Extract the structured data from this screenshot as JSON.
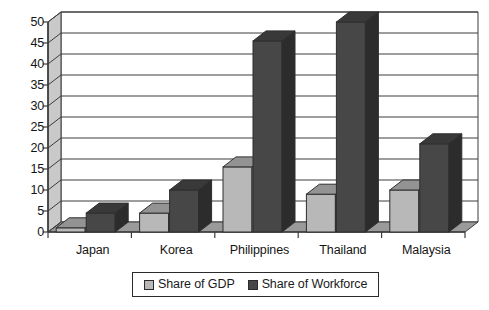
{
  "chart_data": {
    "type": "bar",
    "title": "",
    "subtitle": "",
    "xlabel": "",
    "ylabel": "",
    "categories": [
      "Japan",
      "Korea",
      "Philippines",
      "Thailand",
      "Malaysia"
    ],
    "series": [
      {
        "name": "Share of GDP",
        "values": [
          1,
          4.5,
          15.5,
          9,
          10
        ],
        "color": "#b8b8b8"
      },
      {
        "name": "Share of Workforce",
        "values": [
          4.5,
          10,
          45.5,
          50,
          21
        ],
        "color": "#474747"
      }
    ],
    "ylim": [
      0,
      50
    ],
    "yticks": [
      0,
      5,
      10,
      15,
      20,
      25,
      30,
      35,
      40,
      45,
      50
    ],
    "ytick_labels": [
      "0",
      "5",
      "10",
      "15",
      "20",
      "25",
      "30",
      "35",
      "40",
      "45",
      "50"
    ],
    "grid": true,
    "grid_axis": "y",
    "legend_position": "bottom",
    "style": "3d-column",
    "background": "#ffffff",
    "frame_color": "#3c3c3c"
  },
  "legend": {
    "entries": [
      {
        "label": "Share of GDP",
        "swatch": "light-gray"
      },
      {
        "label": "Share of Workforce",
        "swatch": "dark-gray"
      }
    ]
  },
  "axes": {
    "y_tick_labels": [
      "50",
      "45",
      "40",
      "35",
      "30",
      "25",
      "20",
      "15",
      "10",
      "5",
      "0"
    ],
    "x_tick_labels": [
      "Japan",
      "Korea",
      "Philippines",
      "Thailand",
      "Malaysia"
    ]
  }
}
